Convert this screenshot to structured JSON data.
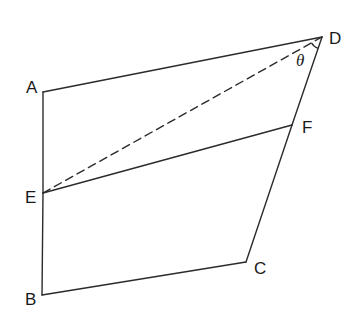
{
  "diagram": {
    "type": "geometry-quadrilateral",
    "points": {
      "A": {
        "x": 43,
        "y": 92
      },
      "B": {
        "x": 42,
        "y": 295
      },
      "C": {
        "x": 246,
        "y": 262
      },
      "D": {
        "x": 322,
        "y": 37
      },
      "E": {
        "x": 43,
        "y": 193
      },
      "F": {
        "x": 292,
        "y": 125
      }
    },
    "edges": [
      {
        "from": "A",
        "to": "D",
        "style": "solid"
      },
      {
        "from": "A",
        "to": "E",
        "style": "solid"
      },
      {
        "from": "E",
        "to": "B",
        "style": "solid"
      },
      {
        "from": "B",
        "to": "C",
        "style": "solid"
      },
      {
        "from": "C",
        "to": "F",
        "style": "solid"
      },
      {
        "from": "F",
        "to": "D",
        "style": "solid"
      },
      {
        "from": "E",
        "to": "F",
        "style": "solid"
      },
      {
        "from": "E",
        "to": "D",
        "style": "dashed"
      }
    ],
    "labels": {
      "A": "A",
      "B": "B",
      "C": "C",
      "D": "D",
      "E": "E",
      "F": "F"
    },
    "angle": {
      "vertex": "D",
      "between": [
        "E",
        "F"
      ],
      "symbol": "θ"
    },
    "colors": {
      "line": "#2b2b2b",
      "text": "#1a1a1a",
      "background": "#ffffff"
    }
  }
}
